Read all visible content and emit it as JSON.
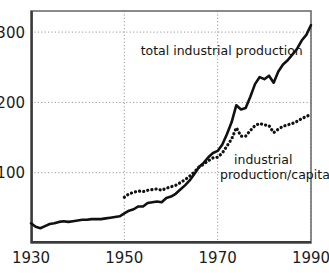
{
  "chart_data": {
    "type": "line",
    "title": "",
    "subtitle": "",
    "xlabel": "",
    "ylabel": "",
    "xlim": [
      1930,
      1990
    ],
    "ylim": [
      0,
      330
    ],
    "grid": true,
    "grid_style": "dotted",
    "legend_position": "inline-annotations",
    "xticks": [
      1930,
      1950,
      1970,
      1990
    ],
    "xtick_labels": [
      "1930",
      "1950",
      "1970",
      "1990"
    ],
    "yticks": [
      100,
      200,
      300
    ],
    "ytick_labels": [
      "100",
      "200",
      "300"
    ],
    "annotations": [
      {
        "id": "total-label",
        "text": "total industrial production",
        "x": 1953.5,
        "y": 268,
        "anchor": "start"
      },
      {
        "id": "per-capita-label-line1",
        "text": "industrial",
        "x": 1973.5,
        "y": 112,
        "anchor": "start"
      },
      {
        "id": "per-capita-label-line2",
        "text": "production/capita",
        "x": 1970.5,
        "y": 91,
        "anchor": "start"
      }
    ],
    "series": [
      {
        "name": "total industrial production",
        "style": "solid",
        "color": "#111111",
        "width": 2.6,
        "x": [
          1930,
          1931,
          1932,
          1933,
          1934,
          1935,
          1936,
          1937,
          1938,
          1939,
          1940,
          1941,
          1942,
          1943,
          1944,
          1945,
          1946,
          1947,
          1948,
          1949,
          1950,
          1951,
          1952,
          1953,
          1954,
          1955,
          1956,
          1957,
          1958,
          1959,
          1960,
          1961,
          1962,
          1963,
          1964,
          1965,
          1966,
          1967,
          1968,
          1969,
          1970,
          1971,
          1972,
          1973,
          1974,
          1975,
          1976,
          1977,
          1978,
          1979,
          1980,
          1981,
          1982,
          1983,
          1984,
          1985,
          1986,
          1987,
          1988,
          1989,
          1990
        ],
        "y": [
          28,
          23,
          21,
          24,
          27,
          28,
          30,
          31,
          30,
          31,
          32,
          33,
          33,
          34,
          34,
          34,
          35,
          36,
          37,
          38,
          42,
          46,
          48,
          52,
          52,
          57,
          58,
          59,
          58,
          64,
          66,
          70,
          76,
          82,
          89,
          98,
          108,
          114,
          122,
          128,
          131,
          140,
          155,
          172,
          196,
          190,
          192,
          208,
          226,
          236,
          233,
          238,
          228,
          244,
          254,
          260,
          268,
          276,
          288,
          296,
          310
        ]
      },
      {
        "name": "industrial production/capita",
        "style": "dotted",
        "color": "#111111",
        "width": 3.2,
        "x": [
          1950,
          1951,
          1952,
          1953,
          1954,
          1955,
          1956,
          1957,
          1958,
          1959,
          1960,
          1961,
          1962,
          1963,
          1964,
          1965,
          1966,
          1967,
          1968,
          1969,
          1970,
          1971,
          1972,
          1973,
          1974,
          1975,
          1976,
          1977,
          1978,
          1979,
          1980,
          1981,
          1982,
          1983,
          1984,
          1985,
          1986,
          1987,
          1988,
          1989,
          1990
        ],
        "y": [
          65,
          70,
          72,
          74,
          73,
          75,
          76,
          77,
          75,
          78,
          80,
          82,
          86,
          90,
          95,
          101,
          108,
          112,
          117,
          121,
          122,
          128,
          138,
          148,
          164,
          152,
          152,
          160,
          167,
          170,
          168,
          167,
          157,
          162,
          166,
          168,
          170,
          173,
          177,
          180,
          183
        ]
      }
    ]
  },
  "axis": {
    "frame_color": "#6f6f6f",
    "grid_color": "#9a9a9a",
    "tick_color": "#1c1c1c"
  }
}
